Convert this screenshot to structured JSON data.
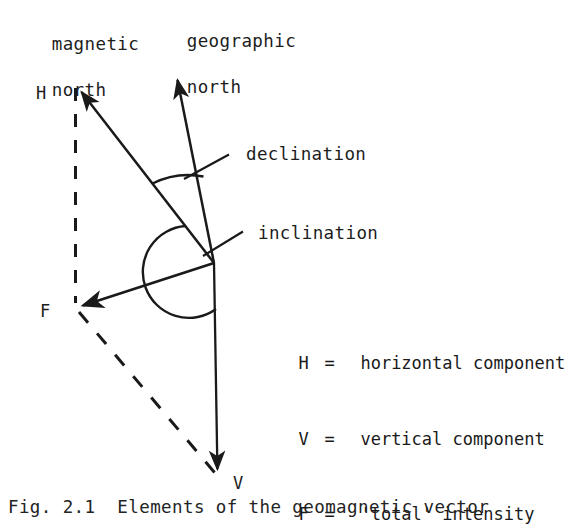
{
  "figure": {
    "background_color": "#ffffff",
    "ink_color": "#1a1a1a",
    "caption": "Fig. 2.1  Elements of the geomagnetic vector"
  },
  "axis_captions": [
    {
      "name": "magnetic-north",
      "line1": "magnetic",
      "line2": "north"
    },
    {
      "name": "geographic-north",
      "line1": "geographic",
      "line2": "north"
    }
  ],
  "vector_labels": [
    {
      "name": "H",
      "text": "H"
    },
    {
      "name": "F",
      "text": "F"
    },
    {
      "name": "V",
      "text": "V"
    }
  ],
  "angle_labels": [
    {
      "name": "declination",
      "text": "declination"
    },
    {
      "name": "inclination",
      "text": "inclination"
    }
  ],
  "legend": {
    "rows": [
      {
        "symbol": "H",
        "equals": "=",
        "definition": "horizontal component"
      },
      {
        "symbol": "V",
        "equals": "=",
        "definition": "vertical component"
      },
      {
        "symbol": "F",
        "equals": "=",
        "definition": "'total' intensity"
      }
    ]
  },
  "geometry": {
    "origin": {
      "x": 214,
      "y": 263
    },
    "h_tip": {
      "x": 75,
      "y": 84
    },
    "geographic_north_tip": {
      "x": 175,
      "y": 70
    },
    "v_tip": {
      "x": 218,
      "y": 478
    },
    "f_tip": {
      "x": 75,
      "y": 308
    }
  }
}
